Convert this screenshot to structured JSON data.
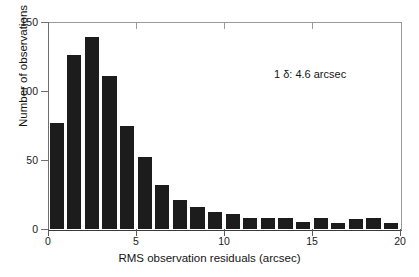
{
  "chart_data": {
    "type": "bar",
    "title": "",
    "xlabel": "RMS observation residuals (arcsec)",
    "ylabel": "Number of observations",
    "xlim": [
      0,
      20
    ],
    "ylim": [
      0,
      150
    ],
    "xticks": [
      "0",
      "5",
      "10",
      "15",
      "20"
    ],
    "xtick_values": [
      0,
      5,
      10,
      15,
      20
    ],
    "yticks": [
      "0",
      "50",
      "100",
      "150"
    ],
    "ytick_values": [
      0,
      50,
      100,
      150
    ],
    "grid": false,
    "legend": null,
    "bin_width": 1,
    "bin_starts": [
      0,
      1,
      2,
      3,
      4,
      5,
      6,
      7,
      8,
      9,
      10,
      11,
      12,
      13,
      14,
      15,
      16,
      17,
      18,
      19
    ],
    "categories": [
      "0-1",
      "1-2",
      "2-3",
      "3-4",
      "4-5",
      "5-6",
      "6-7",
      "7-8",
      "8-9",
      "9-10",
      "10-11",
      "11-12",
      "12-13",
      "13-14",
      "14-15",
      "15-16",
      "16-17",
      "17-18",
      "18-19",
      "19-20"
    ],
    "values": [
      77,
      126,
      139,
      111,
      75,
      52,
      32,
      21,
      16,
      12,
      11,
      8,
      8,
      8,
      5,
      8,
      4,
      7,
      8,
      4
    ],
    "bar_color": "#1c1c1c",
    "annotations": [
      {
        "text": "1 δ: 4.6 arcsec",
        "x": 15.6,
        "y": 118
      }
    ]
  },
  "figure": {
    "annotation_text": "1 δ: 4.6 arcsec",
    "x_axis_title": "RMS observation residuals (arcsec)",
    "y_axis_title": "Number of observations",
    "background_color": "#ffffff",
    "axis_color": "#5a5a5a"
  }
}
